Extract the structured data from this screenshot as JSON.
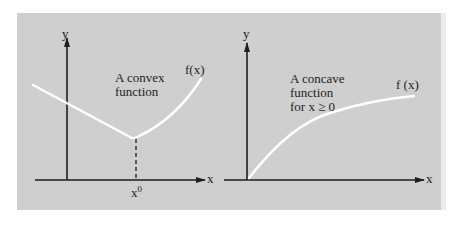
{
  "colors": {
    "panel_background": "#cfcfcf",
    "axis_color": "#1e1e1e",
    "curve_color": "#ffffff",
    "text_color": "#1e1e1e"
  },
  "left_figure": {
    "y_axis_label": "y",
    "x_axis_label": "x",
    "function_label": "f(x)",
    "caption_line1": "A convex",
    "caption_line2": "function",
    "point_label_base": "x",
    "point_label_sup": "0",
    "curve_type": "convex, piecewise: linear decreasing to kink at x0, then increasing curve",
    "dashed_line": "vertical dashed line from kink down to x axis at x0"
  },
  "right_figure": {
    "y_axis_label": "y",
    "x_axis_label": "x",
    "function_label": "f (x)",
    "caption_line1": "A concave",
    "caption_line2": "function",
    "caption_line3": "for x ≥ 0",
    "curve_type": "concave, increasing from origin"
  }
}
